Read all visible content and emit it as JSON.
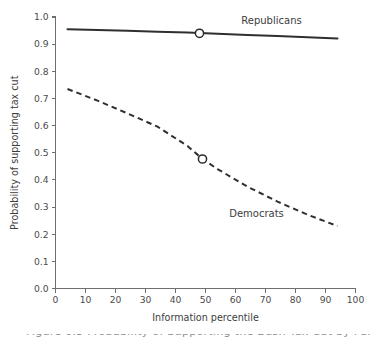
{
  "figure": {
    "background_color": "#ffffff",
    "axis_color": "#6e6e6e",
    "line_color": "#2f2f2f",
    "text_color": "#3d3d3d"
  },
  "chart_data": {
    "type": "line",
    "title": "",
    "subtitle": "",
    "xlabel": "Information percentile",
    "ylabel": "Probability of supporting tax cut",
    "xlim": [
      0,
      100
    ],
    "ylim": [
      0.0,
      1.0
    ],
    "grid": false,
    "legend_position": "inline-annotation",
    "xticks": [
      0,
      10,
      20,
      30,
      40,
      50,
      60,
      70,
      80,
      90,
      100
    ],
    "xticklabels": [
      "0",
      "10",
      "20",
      "30",
      "40",
      "50",
      "60",
      "70",
      "80",
      "90",
      "100"
    ],
    "yticks": [
      0.0,
      0.1,
      0.2,
      0.3,
      0.4,
      0.5,
      0.6,
      0.7,
      0.8,
      0.9,
      1.0
    ],
    "yticklabels": [
      "0.0",
      "0.1",
      "0.2",
      "0.3",
      "0.4",
      "0.5",
      "0.6",
      "0.7",
      "0.8",
      "0.9",
      "1.0"
    ],
    "series": [
      {
        "name": "Republicans",
        "style": "solid",
        "label": "Republicans",
        "label_x": 72,
        "label_y": 0.975,
        "marker": {
          "x": 48,
          "y": 0.94,
          "shape": "open-circle"
        },
        "x": [
          4,
          14,
          24,
          34,
          44,
          48,
          54,
          64,
          74,
          84,
          94
        ],
        "y": [
          0.955,
          0.952,
          0.949,
          0.946,
          0.943,
          0.941,
          0.938,
          0.934,
          0.93,
          0.925,
          0.921
        ]
      },
      {
        "name": "Democrats",
        "style": "dashed",
        "label": "Democrats",
        "label_x": 67,
        "label_y": 0.265,
        "marker": {
          "x": 49,
          "y": 0.477,
          "shape": "open-circle"
        },
        "x": [
          4,
          14,
          24,
          34,
          44,
          49,
          54,
          64,
          74,
          84,
          94
        ],
        "y": [
          0.735,
          0.692,
          0.645,
          0.596,
          0.525,
          0.477,
          0.44,
          0.375,
          0.32,
          0.272,
          0.23
        ]
      }
    ]
  },
  "caption": {
    "text": "Figure 6.5   Probability of Supporting the Bush Tax Cut by Party and Information"
  }
}
